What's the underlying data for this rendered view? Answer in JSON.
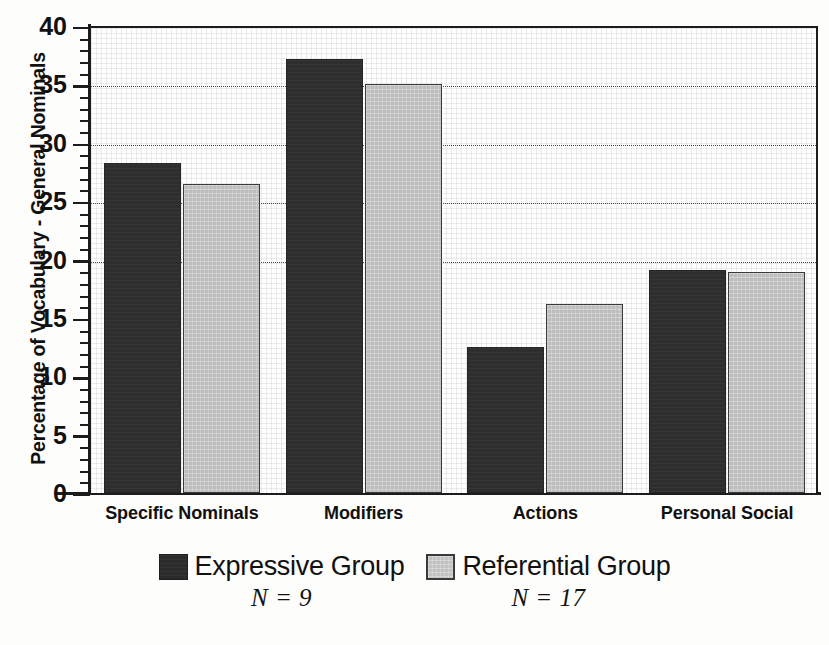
{
  "chart_data": {
    "type": "bar",
    "title": "",
    "xlabel": "",
    "ylabel": "Percentage of Vocabulary - General Nominals",
    "ylim": [
      0,
      40
    ],
    "ytick_step": 5,
    "yticks": [
      "0",
      "5",
      "10",
      "15",
      "20",
      "25",
      "30",
      "35",
      "40"
    ],
    "minor_tick_step": 1,
    "grid": "horizontal-dotted",
    "gridlines_at": [
      20,
      25,
      30,
      35
    ],
    "legend_position": "below-axis",
    "categories": [
      "Specific Nominals",
      "Modifiers",
      "Actions",
      "Personal Social"
    ],
    "series": [
      {
        "name": "Expressive Group",
        "n_label": "N = 9",
        "color": "#2e2e2e",
        "values": [
          28.3,
          37.2,
          12.5,
          19.1
        ]
      },
      {
        "name": "Referential Group",
        "n_label": "N = 17",
        "color": "#bdbdbd",
        "values": [
          26.5,
          35.0,
          16.2,
          18.9
        ]
      }
    ]
  },
  "caption": ""
}
